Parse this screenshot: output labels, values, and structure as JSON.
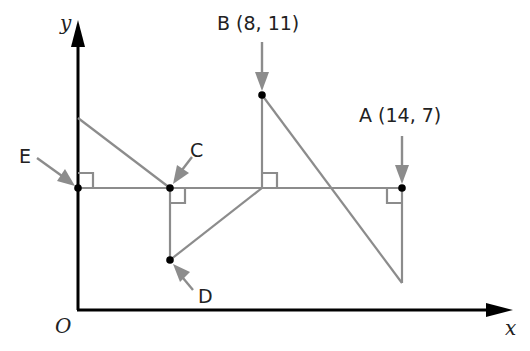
{
  "diagram": {
    "axes": {
      "x_label": "x",
      "y_label": "y",
      "origin_label": "O"
    },
    "points": [
      {
        "name": "A",
        "label": "A (14, 7)",
        "coords": [
          14,
          7
        ]
      },
      {
        "name": "B",
        "label": "B (8, 11)",
        "coords": [
          8,
          11
        ]
      },
      {
        "name": "C",
        "label": "C"
      },
      {
        "name": "D",
        "label": "D"
      },
      {
        "name": "E",
        "label": "E"
      }
    ],
    "colors": {
      "axis": "#000000",
      "line": "#8c8c8c",
      "arrow": "#8c8c8c",
      "point": "#000000"
    }
  }
}
